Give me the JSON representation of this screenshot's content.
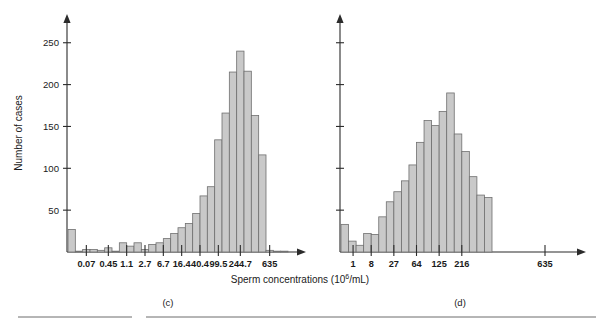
{
  "figure": {
    "background_color": "#ffffff",
    "bar_fill_color": "#c9c9c9",
    "bar_stroke_color": "#6f6f6f",
    "axis_color": "#2b2b2b",
    "shared_xlabel_text": "Sperm concentrations (10",
    "shared_xlabel_sup": "6",
    "shared_xlabel_tail": "/mL)",
    "shared_xlabel_full": "Sperm concentrations (10^6/mL)",
    "panel_c_caption": "(c)",
    "panel_d_caption": "(d)"
  },
  "chart_data": [
    {
      "type": "bar",
      "id": "panel-c",
      "title": "(c)",
      "xlabel": "Sperm concentrations (10^6/mL)",
      "ylabel": "Number of cases",
      "ylim": [
        0,
        270
      ],
      "yticks": [
        50,
        100,
        150,
        200,
        250
      ],
      "ytick_labels": [
        "50",
        "100",
        "150",
        "200",
        "250"
      ],
      "grid": false,
      "legend": "none",
      "x_scale": "logarithmic-bins",
      "categories": [
        "0.07",
        "0.45",
        "1.1",
        "2.7",
        "6.7",
        "16.4",
        "40.4",
        "99.5",
        "244.7",
        "635"
      ],
      "xtick_labels": [
        "0.07",
        "0.45",
        "1.1",
        "2.7",
        "6.7",
        "16.4",
        "40.4",
        "99.5",
        "244.7",
        "635"
      ],
      "bin_count": 26,
      "values": [
        27,
        1,
        3,
        3,
        2,
        5,
        1,
        11,
        7,
        11,
        3,
        9,
        11,
        16,
        22,
        29,
        34,
        46,
        67,
        78,
        134,
        166,
        215,
        240,
        216,
        163,
        116,
        2,
        1,
        1
      ],
      "values_note": "Counts read per bar left-to-right across the 0.02-635 log-spaced bins"
    },
    {
      "type": "bar",
      "id": "panel-d",
      "title": "(d)",
      "xlabel": "Sperm concentrations (10^6/mL)",
      "ylabel": "",
      "ylim": [
        0,
        270
      ],
      "yticks": [
        50,
        100,
        150,
        200,
        250
      ],
      "ytick_labels": [
        "",
        "",
        "",
        "",
        ""
      ],
      "grid": false,
      "legend": "none",
      "x_scale": "cube-root-bins",
      "categories": [
        "1",
        "8",
        "27",
        "64",
        "125",
        "216",
        "635"
      ],
      "xtick_labels": [
        "1",
        "8",
        "27",
        "64",
        "125",
        "216",
        "635"
      ],
      "bin_count": 20,
      "values": [
        33,
        13,
        8,
        22,
        21,
        42,
        60,
        72,
        85,
        104,
        131,
        157,
        151,
        168,
        190,
        141,
        120,
        90,
        68,
        65
      ],
      "values_note": "Counts read per bar left-to-right across the cube-root-spaced bins"
    }
  ]
}
